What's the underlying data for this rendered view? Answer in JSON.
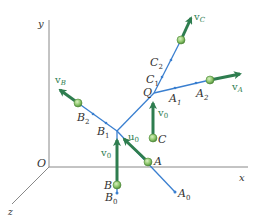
{
  "figure": {
    "colors": {
      "axis": "#888888",
      "line": "#3a7fd0",
      "arrow": "#2e7d4f",
      "ball": "#8cc56a",
      "text": "#333333"
    },
    "axes": {
      "x": "x",
      "y": "y",
      "z": "z",
      "origin": "O"
    },
    "points": {
      "Q": "Q",
      "A": "A",
      "A0": "A",
      "A0_sub": "0",
      "A1": "A",
      "A1_sub": "1",
      "A2": "A",
      "A2_sub": "2",
      "B": "B",
      "B0": "B",
      "B0_sub": "0",
      "B1": "B",
      "B1_sub": "1",
      "B2": "B",
      "B2_sub": "2",
      "C": "C",
      "C1": "C",
      "C1_sub": "1",
      "C2": "C",
      "C2_sub": "2"
    },
    "vectors": {
      "vA": "v",
      "vA_sub": "A",
      "vB": "v",
      "vB_sub": "B",
      "vC": "v",
      "vC_sub": "C",
      "v0_B": "v",
      "v0_B_sub": "0",
      "v0_C": "v",
      "v0_C_sub": "0",
      "u0": "u",
      "u0_sub": "0"
    }
  }
}
